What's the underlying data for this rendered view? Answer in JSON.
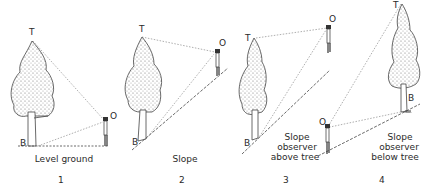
{
  "panels": [
    {
      "number": "1",
      "caption": [
        "Level ground"
      ],
      "points": {
        "top": "T",
        "base": "B",
        "observer": "O"
      }
    },
    {
      "number": "2",
      "caption": [
        "Slope"
      ],
      "points": {
        "top": "T",
        "base": "B",
        "observer": "O"
      }
    },
    {
      "number": "3",
      "caption": [
        "Slope",
        "observer",
        "above tree"
      ],
      "points": {
        "top": "T",
        "base": "B",
        "observer": "O"
      }
    },
    {
      "number": "4",
      "caption": [
        "Slope",
        "observer",
        "below tree"
      ],
      "points": {
        "top": "T",
        "base": "B",
        "observer": "O"
      }
    }
  ],
  "colors": {
    "ink": "#2a2a2a",
    "sightline": "#6a6a6a",
    "foliage": "#9a9a9a",
    "background": "#ffffff"
  }
}
